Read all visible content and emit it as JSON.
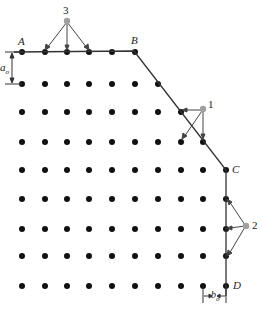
{
  "figure": {
    "type": "lattice-boundary-diagram",
    "colors": {
      "dot": "#111111",
      "line": "#333333",
      "highlight": "#a0a0a0"
    },
    "grid": {
      "rows_y": [
        52,
        84,
        112,
        142,
        170,
        199,
        229,
        256,
        286
      ],
      "cols_x": [
        22,
        45,
        67,
        89,
        112,
        135,
        158,
        181,
        203,
        226
      ]
    },
    "corner_labels": {
      "A": "A",
      "B": "B",
      "C": "C",
      "D": "D"
    },
    "point_labels": {
      "p1": "1",
      "p2": "2",
      "p3": "3"
    },
    "dimensions": {
      "vertical": "a",
      "vertical_sub": "o",
      "horizontal": "b",
      "horizontal_sub": "o"
    }
  }
}
